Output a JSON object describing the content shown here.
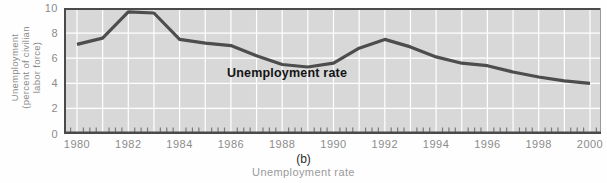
{
  "figure": {
    "panel_label": "(b)",
    "caption": "Unemployment rate",
    "series_label": "Unemployment rate",
    "y_axis_title_lines": [
      "Unemployment",
      "(percent of civilian",
      "labor force)"
    ]
  },
  "chart_data": {
    "type": "line",
    "title": "",
    "xlabel": "(b) Unemployment rate",
    "ylabel": "Unemployment (percent of civilian labor force)",
    "x": [
      1980,
      1981,
      1982,
      1983,
      1984,
      1985,
      1986,
      1987,
      1988,
      1989,
      1990,
      1991,
      1992,
      1993,
      1994,
      1995,
      1996,
      1997,
      1998,
      1999,
      2000
    ],
    "values": [
      7.1,
      7.6,
      9.7,
      9.6,
      7.5,
      7.2,
      7.0,
      6.2,
      5.5,
      5.3,
      5.6,
      6.8,
      7.5,
      6.9,
      6.1,
      5.6,
      5.4,
      4.9,
      4.5,
      4.2,
      4.0
    ],
    "x_tick_labels": [
      "1980",
      "1982",
      "1984",
      "1986",
      "1988",
      "1990",
      "1992",
      "1994",
      "1996",
      "1998",
      "2000"
    ],
    "y_ticks": [
      0,
      2,
      4,
      6,
      8,
      10
    ],
    "ylim": [
      0,
      10
    ],
    "xlim": [
      1980,
      2000
    ],
    "grid": true,
    "legend_position": "none",
    "annotation": "Unemployment rate",
    "minor_ticks": "quarterly",
    "colors": {
      "plot_background": "#d8d8d8",
      "gridline": "#ffffff",
      "line": "#4d4d4d",
      "frame": "#4a4a4a",
      "frame_right": "#9a9a9a",
      "minor_tick": "#7a7a7a",
      "tick_label": "#8b8b8b"
    }
  }
}
